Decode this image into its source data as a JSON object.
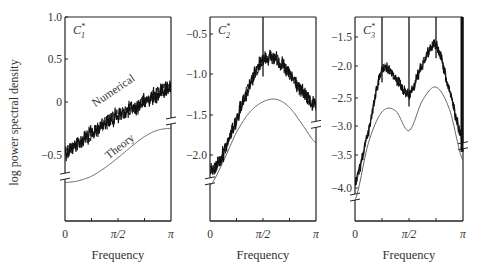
{
  "figure": {
    "ylabel": "log power spectral density",
    "xlabel": "Frequency"
  },
  "chart_data": [
    {
      "type": "line",
      "title": "C1*",
      "panel_label": "C",
      "panel_sub": "1",
      "panel_sup": "*",
      "xlabel": "Frequency",
      "ylabel": "log power spectral density",
      "x_ticks": [
        "0",
        "π/2",
        "π"
      ],
      "y_ticks": [
        "1.0",
        "0.5",
        "0",
        "−0.5"
      ],
      "y_tick_values": [
        1.0,
        0.5,
        0,
        -0.5
      ],
      "ylim": [
        -0.75,
        1.0
      ],
      "xlim": [
        0,
        3.1416
      ],
      "annotations": [
        {
          "text": "Numerical",
          "x": 0.9,
          "y": 0.02,
          "rotation": -34
        },
        {
          "text": "Theory",
          "x": 1.3,
          "y": -0.55,
          "rotation": -38
        }
      ],
      "series": [
        {
          "name": "Numerical",
          "x": [
            0,
            0.3927,
            0.7854,
            1.1781,
            1.5708,
            1.9635,
            2.3562,
            2.7489,
            3.1416
          ],
          "values": [
            -0.47,
            -0.37,
            -0.27,
            -0.15,
            -0.07,
            0.0,
            0.08,
            0.17,
            0.25
          ],
          "noise": "high"
        },
        {
          "name": "Theory",
          "x": [
            0,
            0.3927,
            0.7854,
            1.1781,
            1.5708,
            1.9635,
            2.3562,
            2.7489,
            3.1416
          ],
          "values": [
            -0.8,
            -0.78,
            -0.73,
            -0.64,
            -0.53,
            -0.41,
            -0.3,
            -0.23,
            -0.21
          ],
          "note": "offset axis (below break)"
        }
      ],
      "axis_break": {
        "left_y": -0.73,
        "right_y": -0.13
      }
    },
    {
      "type": "line",
      "title": "C2*",
      "panel_label": "C",
      "panel_sub": "2",
      "panel_sup": "*",
      "xlabel": "Frequency",
      "x_ticks": [
        "0",
        "π/2",
        "π"
      ],
      "y_ticks": [
        "−0.5",
        "−1.0",
        "−1.5",
        "−2.0"
      ],
      "y_tick_values": [
        -0.5,
        -1.0,
        -1.5,
        -2.0
      ],
      "ylim": [
        -2.5,
        -0.3
      ],
      "xlim": [
        0,
        3.1416
      ],
      "series": [
        {
          "name": "Numerical",
          "x": [
            0,
            0.3927,
            0.7854,
            1.1781,
            1.5708,
            1.9635,
            2.3562,
            2.7489,
            3.1416
          ],
          "values": [
            -2.22,
            -1.98,
            -1.55,
            -1.13,
            -0.82,
            -0.82,
            -1.0,
            -1.22,
            -1.4
          ],
          "spikes": [
            1.5708
          ],
          "noise": "high"
        },
        {
          "name": "Theory",
          "x": [
            0,
            0.3927,
            0.7854,
            1.1781,
            1.5708,
            1.9635,
            2.3562,
            2.7489,
            3.1416
          ],
          "values": [
            -2.38,
            -2.08,
            -1.72,
            -1.47,
            -1.34,
            -1.31,
            -1.41,
            -1.63,
            -1.85
          ],
          "note": "offset axis (below break)"
        }
      ],
      "axis_break": {
        "left_y": -2.32,
        "right_y": -1.62
      }
    },
    {
      "type": "line",
      "title": "C3*",
      "panel_label": "C",
      "panel_sub": "3",
      "panel_sup": "*",
      "xlabel": "Frequency",
      "x_ticks": [
        "0",
        "π/2",
        "π"
      ],
      "y_ticks": [
        "−1.5",
        "−2.0",
        "−2.5",
        "−3.0",
        "−3.5",
        "−4.0"
      ],
      "y_tick_values": [
        -1.5,
        -2.0,
        -2.5,
        -3.0,
        -3.5,
        -4.0
      ],
      "ylim": [
        -4.55,
        -1.25
      ],
      "xlim": [
        0,
        3.1416
      ],
      "series": [
        {
          "name": "Numerical",
          "x": [
            0,
            0.3927,
            0.7854,
            1.1781,
            1.5708,
            1.9635,
            2.3562,
            2.7489,
            3.1416
          ],
          "values": [
            -3.9,
            -3.05,
            -2.05,
            -2.18,
            -2.45,
            -1.95,
            -1.65,
            -2.4,
            -3.2
          ],
          "spikes": [
            0.7854,
            1.5708,
            2.3562,
            3.1416
          ],
          "noise": "high"
        },
        {
          "name": "Theory",
          "x": [
            0,
            0.3927,
            0.7854,
            1.1781,
            1.5708,
            1.9635,
            2.3562,
            2.7489,
            3.1416
          ],
          "values": [
            -4.2,
            -3.25,
            -2.74,
            -2.72,
            -3.05,
            -2.55,
            -2.33,
            -2.7,
            -3.55
          ],
          "note": "offset axis (below break)"
        }
      ],
      "axis_break": {
        "left_y": -4.15,
        "right_y": -3.3
      }
    }
  ],
  "panels_layout": [
    {
      "left": 65,
      "right": 171,
      "top": 17,
      "bottom": 221,
      "y_px": [
        17,
        59,
        102,
        155
      ]
    },
    {
      "left": 210,
      "right": 316,
      "top": 17,
      "bottom": 221,
      "y_px": [
        34,
        74,
        115,
        155
      ]
    },
    {
      "left": 355,
      "right": 463,
      "top": 17,
      "bottom": 221,
      "y_px": [
        37,
        66,
        98,
        126,
        155,
        188
      ]
    }
  ]
}
